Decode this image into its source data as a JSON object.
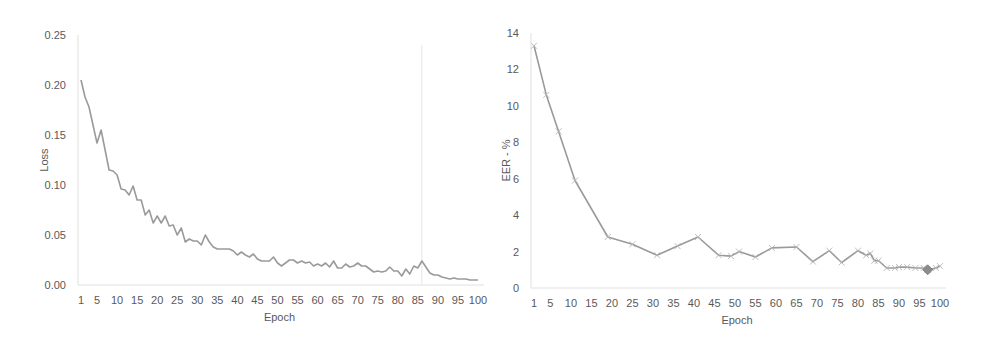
{
  "chart_data": [
    {
      "id": "loss",
      "type": "line",
      "title": "",
      "xlabel": "Epoch",
      "ylabel": "Loss",
      "ylim": [
        0,
        0.25
      ],
      "yticks": [
        "0.00",
        "0.05",
        "0.10",
        "0.15",
        "0.20",
        "0.25"
      ],
      "ytick_values": [
        0,
        0.05,
        0.1,
        0.15,
        0.2,
        0.25
      ],
      "xticks": [
        1,
        5,
        10,
        15,
        20,
        25,
        30,
        35,
        40,
        45,
        50,
        55,
        60,
        65,
        70,
        75,
        80,
        85,
        90,
        95,
        100
      ],
      "xlim": [
        1,
        100
      ],
      "grid": false,
      "vline_epoch": 86,
      "line_color": "#9a9a9a",
      "series": [
        {
          "name": "Loss",
          "x": [
            1,
            2,
            3,
            4,
            5,
            6,
            7,
            8,
            9,
            10,
            11,
            12,
            13,
            14,
            15,
            16,
            17,
            18,
            19,
            20,
            21,
            22,
            23,
            24,
            25,
            26,
            27,
            28,
            29,
            30,
            31,
            32,
            33,
            34,
            35,
            36,
            37,
            38,
            39,
            40,
            41,
            42,
            43,
            44,
            45,
            46,
            47,
            48,
            49,
            50,
            51,
            52,
            53,
            54,
            55,
            56,
            57,
            58,
            59,
            60,
            61,
            62,
            63,
            64,
            65,
            66,
            67,
            68,
            69,
            70,
            71,
            72,
            73,
            74,
            75,
            76,
            77,
            78,
            79,
            80,
            81,
            82,
            83,
            84,
            85,
            86,
            87,
            88,
            89,
            90,
            91,
            92,
            93,
            94,
            95,
            96,
            97,
            98,
            99,
            100
          ],
          "values": [
            0.205,
            0.188,
            0.178,
            0.16,
            0.142,
            0.155,
            0.135,
            0.115,
            0.114,
            0.11,
            0.096,
            0.095,
            0.09,
            0.099,
            0.085,
            0.085,
            0.07,
            0.075,
            0.062,
            0.069,
            0.062,
            0.069,
            0.059,
            0.06,
            0.05,
            0.057,
            0.043,
            0.046,
            0.044,
            0.044,
            0.04,
            0.05,
            0.043,
            0.038,
            0.036,
            0.036,
            0.036,
            0.036,
            0.034,
            0.03,
            0.033,
            0.03,
            0.028,
            0.031,
            0.026,
            0.024,
            0.024,
            0.024,
            0.028,
            0.022,
            0.019,
            0.022,
            0.025,
            0.025,
            0.022,
            0.024,
            0.022,
            0.023,
            0.019,
            0.021,
            0.019,
            0.022,
            0.018,
            0.024,
            0.017,
            0.017,
            0.021,
            0.018,
            0.019,
            0.022,
            0.019,
            0.019,
            0.016,
            0.013,
            0.014,
            0.013,
            0.014,
            0.018,
            0.014,
            0.014,
            0.009,
            0.016,
            0.011,
            0.019,
            0.017,
            0.024,
            0.018,
            0.012,
            0.01,
            0.01,
            0.008,
            0.007,
            0.006,
            0.007,
            0.006,
            0.006,
            0.006,
            0.005,
            0.005,
            0.005
          ]
        }
      ]
    },
    {
      "id": "eer",
      "type": "line",
      "title": "",
      "xlabel": "Epoch",
      "ylabel": "EER - %",
      "ylim": [
        0,
        14
      ],
      "yticks": [
        "0",
        "2",
        "4",
        "6",
        "8",
        "10",
        "12",
        "14"
      ],
      "ytick_values": [
        0,
        2,
        4,
        6,
        8,
        10,
        12,
        14
      ],
      "xticks": [
        1,
        5,
        10,
        15,
        20,
        25,
        30,
        35,
        40,
        45,
        50,
        55,
        60,
        65,
        70,
        75,
        80,
        85,
        90,
        95,
        100
      ],
      "xlim": [
        1,
        100
      ],
      "grid": false,
      "line_color": "#9a9a9a",
      "marker": "x",
      "highlight": {
        "epoch": 97,
        "value": 1.0,
        "marker": "diamond",
        "color": "#8c8c8c"
      },
      "series": [
        {
          "name": "EER",
          "x": [
            1,
            4,
            7,
            11,
            19,
            25,
            31,
            36,
            41,
            46,
            49,
            51,
            55,
            59,
            65,
            69,
            73,
            76,
            80,
            82,
            83,
            84,
            85,
            87,
            89,
            90,
            92,
            94,
            96,
            97,
            99,
            100
          ],
          "values": [
            13.3,
            10.6,
            8.6,
            5.9,
            2.8,
            2.4,
            1.8,
            2.3,
            2.8,
            1.8,
            1.75,
            2.0,
            1.7,
            2.2,
            2.25,
            1.45,
            2.05,
            1.4,
            2.05,
            1.8,
            1.9,
            1.5,
            1.5,
            1.1,
            1.1,
            1.15,
            1.15,
            1.1,
            1.1,
            1.0,
            1.1,
            1.2
          ]
        }
      ]
    }
  ]
}
